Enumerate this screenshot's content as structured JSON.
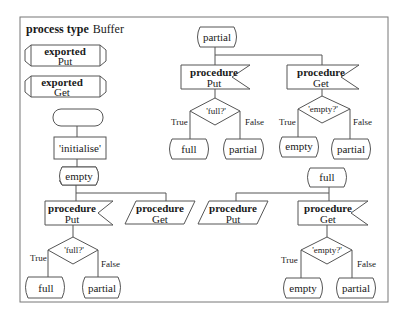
{
  "diagram": {
    "title_keyword": "process type",
    "title_name": "Buffer",
    "exported": [
      {
        "keyword": "exported",
        "name": "Put"
      },
      {
        "keyword": "exported",
        "name": "Get"
      }
    ],
    "start": {
      "label": ""
    },
    "task": {
      "label": "'initialise'"
    },
    "states": {
      "empty": {
        "label": "empty",
        "inputs": [
          {
            "keyword": "procedure",
            "name": "Put",
            "kind": "receive"
          },
          {
            "keyword": "procedure",
            "name": "Get",
            "kind": "save"
          }
        ],
        "decision": {
          "label": "'full?'",
          "true_label": "True",
          "false_label": "False",
          "true_next": "full",
          "false_next": "partial"
        }
      },
      "partial": {
        "label": "partial",
        "inputs": [
          {
            "keyword": "procedure",
            "name": "Put",
            "kind": "receive"
          },
          {
            "keyword": "procedure",
            "name": "Get",
            "kind": "receive"
          }
        ],
        "decision_put": {
          "label": "'full?'",
          "true_label": "True",
          "false_label": "False",
          "true_next": "full",
          "false_next": "partial"
        },
        "decision_get": {
          "label": "'empty?'",
          "true_label": "True",
          "false_label": "False",
          "true_next": "empty",
          "false_next": "partial"
        }
      },
      "full": {
        "label": "full",
        "inputs": [
          {
            "keyword": "procedure",
            "name": "Put",
            "kind": "save"
          },
          {
            "keyword": "procedure",
            "name": "Get",
            "kind": "receive"
          }
        ],
        "decision": {
          "label": "'empty?'",
          "true_label": "True",
          "false_label": "False",
          "true_next": "empty",
          "false_next": "partial"
        }
      }
    }
  }
}
